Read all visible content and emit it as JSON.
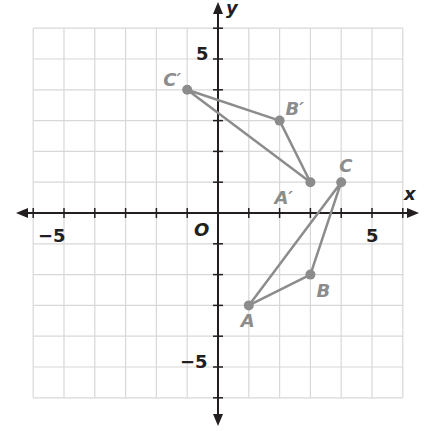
{
  "axes": {
    "x_label": "x",
    "y_label": "y",
    "origin_label": "O",
    "x_ticks": [
      {
        "value": -5,
        "label": "−5"
      },
      {
        "value": 5,
        "label": "5"
      }
    ],
    "y_ticks": [
      {
        "value": 5,
        "label": "5"
      },
      {
        "value": -5,
        "label": "−5"
      }
    ],
    "range": [
      -6,
      6
    ]
  },
  "triangles": [
    {
      "name": "ABC",
      "points": [
        {
          "label": "A",
          "x": 1,
          "y": -3
        },
        {
          "label": "B",
          "x": 3,
          "y": -2
        },
        {
          "label": "C",
          "x": 4,
          "y": 1
        }
      ]
    },
    {
      "name": "A'B'C'",
      "points": [
        {
          "label": "A′",
          "x": 3,
          "y": 1
        },
        {
          "label": "B′",
          "x": 2,
          "y": 3
        },
        {
          "label": "C′",
          "x": -1,
          "y": 4
        }
      ]
    }
  ],
  "colors": {
    "grid": "#d8d8d8",
    "axis": "#231f20",
    "shape": "#8c8c8c",
    "label": "#8c8c8c"
  }
}
